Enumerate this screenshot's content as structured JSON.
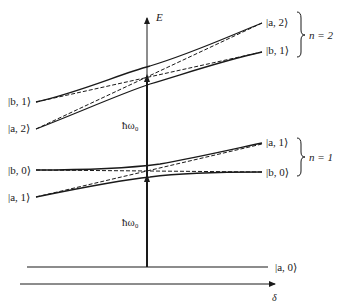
{
  "diagram": {
    "axes": {
      "energy_label": "E",
      "detuning_label": "δ"
    },
    "photon_energy_labels": [
      "ħω₀",
      "ħω₀"
    ],
    "levels": {
      "ground": {
        "right": "|a, 0⟩"
      },
      "n1": {
        "left_upper": "|b, 0⟩",
        "left_lower": "|a, 1⟩",
        "right_upper": "|a, 1⟩",
        "right_lower": "|b, 0⟩",
        "manifold": "n = 1"
      },
      "n2": {
        "left_upper": "|b, 1⟩",
        "left_lower": "|a, 2⟩",
        "right_upper": "|a, 2⟩",
        "right_lower": "|b, 1⟩",
        "manifold": "n = 2"
      }
    },
    "colors": {
      "line": "#1a1a1a",
      "background": "#ffffff"
    }
  }
}
